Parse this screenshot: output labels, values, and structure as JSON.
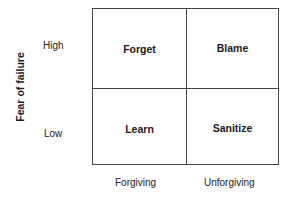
{
  "diagram": {
    "y_axis": {
      "title": "Fear of failure",
      "high": "High",
      "low": "Low"
    },
    "x_axis": {
      "left": "Forgiving",
      "right": "Unforgiving"
    },
    "quadrants": {
      "top_left": "Forget",
      "top_right": "Blame",
      "bottom_left": "Learn",
      "bottom_right": "Sanitize"
    }
  }
}
